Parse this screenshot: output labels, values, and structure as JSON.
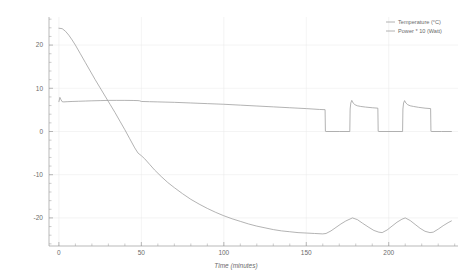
{
  "chart_data": {
    "type": "line",
    "title": "",
    "xlabel": "Time (minutes)",
    "ylabel": "",
    "xlim": [
      -6,
      242
    ],
    "ylim": [
      -26.5,
      26.5
    ],
    "grid": true,
    "legend_position": "top-right",
    "xticks": [
      0,
      50,
      100,
      150,
      200
    ],
    "xtick_labels": [
      "0",
      "50",
      "100",
      "150",
      "200"
    ],
    "yticks": [
      20,
      10,
      0,
      -10,
      -20
    ],
    "ytick_labels": [
      "20",
      "10",
      "0",
      "-10",
      "-20"
    ],
    "xminor_step": 10,
    "yminor_step": 2,
    "series": [
      {
        "name": "Temperature (°C)",
        "color": "#9a9a9a",
        "x": [
          0,
          2,
          4,
          6,
          8,
          10,
          13,
          16,
          19,
          22,
          25,
          28,
          31,
          34,
          37,
          40,
          43,
          46,
          48,
          50,
          52,
          55,
          58,
          62,
          66,
          70,
          75,
          80,
          85,
          90,
          95,
          100,
          105,
          110,
          115,
          120,
          125,
          130,
          135,
          140,
          145,
          150,
          155,
          160,
          162,
          165,
          168,
          171,
          174,
          178,
          181,
          184,
          188,
          191,
          194,
          196,
          199,
          202,
          205,
          208,
          210,
          213,
          216,
          219,
          222,
          225,
          227,
          230,
          233,
          236,
          238
        ],
        "y": [
          23.9,
          23.8,
          23.2,
          22.3,
          21.2,
          20.0,
          18.0,
          16.0,
          14.0,
          12.0,
          10.1,
          8.2,
          6.3,
          4.4,
          2.4,
          0.4,
          -1.7,
          -3.8,
          -5.0,
          -5.6,
          -6.3,
          -7.6,
          -8.9,
          -10.4,
          -11.8,
          -13.0,
          -14.4,
          -15.7,
          -16.8,
          -17.8,
          -18.7,
          -19.5,
          -20.2,
          -20.8,
          -21.4,
          -21.9,
          -22.3,
          -22.7,
          -23.0,
          -23.2,
          -23.4,
          -23.5,
          -23.6,
          -23.7,
          -23.6,
          -23.0,
          -22.2,
          -21.4,
          -20.7,
          -20.0,
          -20.4,
          -21.2,
          -22.2,
          -22.9,
          -23.3,
          -23.4,
          -22.8,
          -21.9,
          -21.0,
          -20.3,
          -20.0,
          -20.6,
          -21.5,
          -22.4,
          -23.1,
          -23.4,
          -23.3,
          -22.6,
          -21.8,
          -21.1,
          -20.7
        ]
      },
      {
        "name": "Power * 10 (Watt)",
        "color": "#9a9a9a",
        "x": [
          0,
          0.6,
          1.2,
          2,
          3,
          5,
          8,
          12,
          16,
          20,
          25,
          30,
          35,
          40,
          45,
          48,
          49,
          50,
          55,
          60,
          70,
          80,
          90,
          100,
          110,
          120,
          130,
          140,
          150,
          158,
          161.4,
          161.6,
          162,
          170,
          176.4,
          176.6,
          177,
          177.6,
          178.4,
          179.5,
          181,
          183,
          186,
          190,
          193.4,
          193.6,
          194,
          202,
          208.4,
          208.6,
          209,
          209.6,
          210.4,
          211.5,
          213,
          215,
          218,
          222,
          225.4,
          225.6,
          226,
          232,
          238
        ],
        "y": [
          6.9,
          7.9,
          7.4,
          6.9,
          6.85,
          6.9,
          6.95,
          7.0,
          7.05,
          7.1,
          7.15,
          7.2,
          7.2,
          7.2,
          7.18,
          7.15,
          7.1,
          6.95,
          6.9,
          6.85,
          6.75,
          6.6,
          6.45,
          6.3,
          6.1,
          5.9,
          5.7,
          5.5,
          5.3,
          5.1,
          5.05,
          0.05,
          0.0,
          0.0,
          0.0,
          5.2,
          6.6,
          7.2,
          6.6,
          6.2,
          5.95,
          5.8,
          5.65,
          5.5,
          5.4,
          0.05,
          0.0,
          0.0,
          0.0,
          5.2,
          6.6,
          7.15,
          6.6,
          6.2,
          5.95,
          5.8,
          5.6,
          5.4,
          5.3,
          0.05,
          0.0,
          0.0,
          0.0
        ]
      }
    ]
  },
  "legend": {
    "items": [
      {
        "label": "Temperature (°C)"
      },
      {
        "label": "Power * 10 (Watt)"
      }
    ]
  },
  "axes": {
    "x_title": "Time (minutes)"
  }
}
